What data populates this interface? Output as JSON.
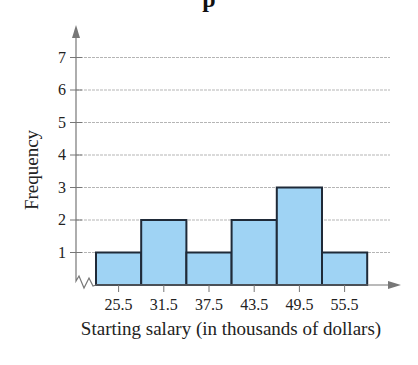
{
  "chart_data": {
    "type": "bar",
    "subtype": "histogram",
    "title_visible_fragment": "p",
    "xlabel": "Starting salary (in thousands of dollars)",
    "ylabel": "Frequency",
    "categories": [
      "25.5",
      "31.5",
      "37.5",
      "43.5",
      "49.5",
      "55.5"
    ],
    "values": [
      1,
      2,
      1,
      2,
      3,
      1
    ],
    "yticks": [
      1,
      2,
      3,
      4,
      5,
      6,
      7
    ],
    "ylim": [
      0,
      7.8
    ],
    "grid": true,
    "axis_break_on_x": true,
    "legend": null,
    "colors": {
      "bar_fill": "#9fd3f4",
      "bar_edge": "#1f2a38",
      "grid": "#b5b5b5",
      "axis": "#777777"
    }
  },
  "labels": {
    "title": "p",
    "ylabel": "Frequency",
    "xlabel": "Starting salary (in thousands of dollars)"
  }
}
